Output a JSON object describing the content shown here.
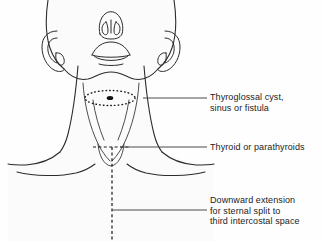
{
  "figure": {
    "view": "frontal",
    "background_color": "#fefefe",
    "skin_fill_color": "#fbfbfb",
    "outline_color": "#2b2b2b",
    "leader_line_color": "#4a4a4a",
    "text_color": "#1c1c1c",
    "marker_fill_color": "#111111"
  },
  "labels": [
    {
      "id": "thyroglossal",
      "name": "thyroglossal-cyst-label",
      "lines": [
        "Thyroglossal cyst,",
        "sinus or fistula"
      ],
      "line1": "Thyroglossal cyst,",
      "line2": "sinus or fistula",
      "leader": {
        "x1": 143,
        "y1": 98,
        "x2": 207,
        "y2": 98
      },
      "target": "dotted ellipse over hyoid / midline neck"
    },
    {
      "id": "thyroid",
      "name": "thyroid-parathyroids-label",
      "lines": [
        "Thyroid or parathyroids"
      ],
      "line1": "Thyroid or parathyroids",
      "leader": {
        "x1": 120,
        "y1": 147,
        "x2": 207,
        "y2": 147
      },
      "target": "suprasternal notch / thyroid bed"
    },
    {
      "id": "sternal",
      "name": "sternal-split-label",
      "lines": [
        "Downward extension",
        "for sternal split to",
        "third intercostal space"
      ],
      "line1": "Downward extension",
      "line2": "for sternal split to",
      "line3": "third intercostal space",
      "leader": {
        "x1": 112,
        "y1": 210,
        "x2": 207,
        "y2": 210
      },
      "target": "vertical dashed midline extension"
    }
  ],
  "markings": {
    "dotted_ellipse": {
      "name": "thyroglossal-cyst-ellipse",
      "cx": 110,
      "cy": 98,
      "rx": 25,
      "ry": 7.5,
      "style": "dotted"
    },
    "center_dot": {
      "name": "cyst-center-marker",
      "cx": 110,
      "cy": 98,
      "rx": 3.2,
      "ry": 1.9
    },
    "collar_incision": {
      "name": "collar-incision-dashed-line",
      "x1": 93,
      "y1": 147,
      "x2": 128,
      "y2": 147,
      "style": "dashed"
    },
    "midline_extension": {
      "name": "sternal-split-dashed-line",
      "x1": 112,
      "y1": 147,
      "x2": 112,
      "y2": 241,
      "style": "dashed"
    }
  }
}
